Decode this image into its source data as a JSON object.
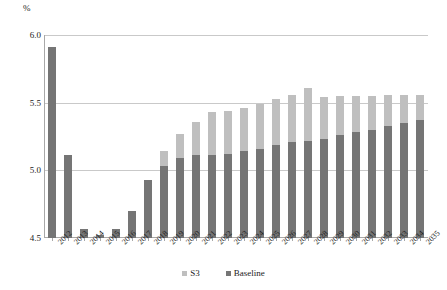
{
  "chart_data": {
    "type": "bar",
    "title": "",
    "subtitle": "",
    "xlabel": "",
    "ylabel": "%",
    "ylim": [
      4.5,
      6.0
    ],
    "yticks": [
      4.5,
      5.0,
      5.5,
      6.0
    ],
    "ytick_labels": [
      "4.5",
      "5.0",
      "5.5",
      "6.0"
    ],
    "grid": true,
    "grid_axis": "y",
    "legend_position": "bottom-center",
    "bar_mode": "overlaid",
    "categories": [
      "2012",
      "2013",
      "2014",
      "2015",
      "2016",
      "2017",
      "2018",
      "2019",
      "2020",
      "2021",
      "2022",
      "2023",
      "2024",
      "2025",
      "2026",
      "2027",
      "2028",
      "2029",
      "2030",
      "2031",
      "2032",
      "2033",
      "2034",
      "2035"
    ],
    "series": [
      {
        "name": "S3",
        "color": "#bfbfbf",
        "values": [
          5.91,
          5.11,
          4.57,
          4.52,
          4.57,
          4.7,
          4.93,
          5.14,
          5.27,
          5.36,
          5.43,
          5.44,
          5.46,
          5.49,
          5.53,
          5.56,
          5.61,
          5.54,
          5.55,
          5.55,
          5.55,
          5.56,
          5.56,
          5.56
        ]
      },
      {
        "name": "Baseline",
        "color": "#757575",
        "values": [
          5.91,
          5.11,
          4.57,
          4.52,
          4.57,
          4.7,
          4.93,
          5.03,
          5.09,
          5.11,
          5.11,
          5.12,
          5.14,
          5.16,
          5.19,
          5.21,
          5.22,
          5.23,
          5.26,
          5.28,
          5.3,
          5.33,
          5.35,
          5.37
        ]
      }
    ]
  },
  "legend": {
    "items": [
      {
        "label": "S3",
        "color": "#bfbfbf"
      },
      {
        "label": "Baseline",
        "color": "#757575"
      }
    ]
  },
  "axis": {
    "y_unit": "%"
  }
}
